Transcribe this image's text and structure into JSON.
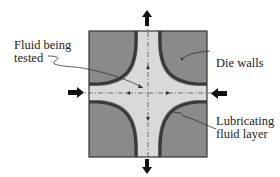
{
  "diagram": {
    "type": "hyperbolic-die-cross-section",
    "labels": {
      "fluid_tested": "Fluid being\ntested",
      "die_walls": "Die walls",
      "lubricating_layer": "Lubricating\nfluid layer"
    },
    "arrows": {
      "inflow": [
        "left",
        "right"
      ],
      "outflow": [
        "top",
        "bottom"
      ]
    },
    "colors": {
      "die_wall": "#8a8a8a",
      "die_border": "#333333",
      "lubricant": "#3a3a3a",
      "fluid": "#d9d9d9",
      "centerline": "#555555",
      "arrow": "#111111"
    }
  }
}
